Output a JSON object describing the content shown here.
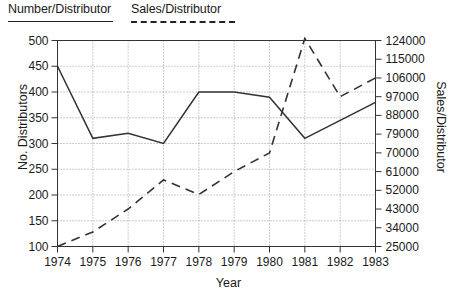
{
  "legend": {
    "series": [
      {
        "label": "Number/Distributor",
        "style": "solid"
      },
      {
        "label": "Sales/Distributor",
        "style": "dashed"
      }
    ]
  },
  "axes": {
    "x_title": "Year",
    "left_title": "No. Distributors",
    "right_title": "Sales/Distributor"
  },
  "chart_data": {
    "type": "line",
    "title": "",
    "xlabel": "Year",
    "ylabel": "No. Distributors",
    "y2label": "Sales/Distributor",
    "categories": [
      1974,
      1975,
      1976,
      1977,
      1978,
      1979,
      1980,
      1981,
      1982,
      1983
    ],
    "x_tick_labels": [
      "1974",
      "1975",
      "1976",
      "1977",
      "1978",
      "1979",
      "1980",
      "1981",
      "1982",
      "1983"
    ],
    "ylim": [
      100,
      500
    ],
    "y_ticks": [
      100,
      150,
      200,
      250,
      300,
      350,
      400,
      450,
      500
    ],
    "y_tick_labels": [
      "100",
      "150",
      "200",
      "250",
      "300",
      "350",
      "400",
      "450",
      "500"
    ],
    "y2lim": [
      25000,
      124000
    ],
    "y2_ticks": [
      25000,
      34000,
      43000,
      52000,
      61000,
      70000,
      79000,
      88000,
      97000,
      106000,
      115000,
      124000
    ],
    "y2_tick_labels": [
      "25000",
      "34000",
      "43000",
      "52000",
      "61000",
      "70000",
      "79000",
      "88000",
      "97000",
      "106000",
      "115000",
      "124000"
    ],
    "grid": true,
    "legend_position": "above-plot",
    "series": [
      {
        "name": "Number/Distributor",
        "axis": "left",
        "style": "solid",
        "values": [
          450,
          310,
          320,
          300,
          400,
          400,
          390,
          310,
          345,
          380
        ]
      },
      {
        "name": "Sales/Distributor",
        "axis": "right",
        "style": "dashed",
        "values": [
          25000,
          32000,
          43000,
          57000,
          50000,
          61000,
          70000,
          125000,
          97000,
          106000
        ]
      }
    ]
  }
}
